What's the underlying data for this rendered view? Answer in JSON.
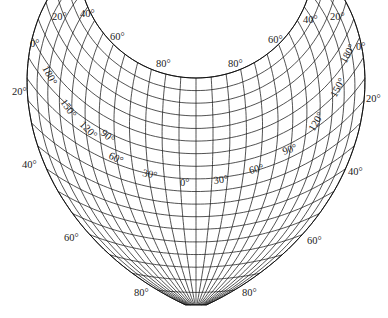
{
  "figure": {
    "type": "map-projection-graticule",
    "line_color": "#1a1a1a",
    "background": "#ffffff"
  },
  "labels": {
    "outer_left": [
      {
        "id": "lat-20-top-left",
        "text": "20°"
      },
      {
        "id": "lat-40-top-left",
        "text": "40°"
      },
      {
        "id": "lat-60-top-left",
        "text": "60°"
      },
      {
        "id": "lat-80-top-left",
        "text": "80°"
      },
      {
        "id": "lat-0-left",
        "text": "0°"
      },
      {
        "id": "lat-20-left",
        "text": "20°"
      },
      {
        "id": "lat-40-left",
        "text": "40°"
      },
      {
        "id": "lat-60-left",
        "text": "60°"
      },
      {
        "id": "lat-80-bottom-left",
        "text": "80°"
      }
    ],
    "outer_right": [
      {
        "id": "lat-20-top-right",
        "text": "20°"
      },
      {
        "id": "lat-40-top-right",
        "text": "40°"
      },
      {
        "id": "lat-60-top-right",
        "text": "60°"
      },
      {
        "id": "lat-80-top-right",
        "text": "80°"
      },
      {
        "id": "lat-0-right",
        "text": "0°"
      },
      {
        "id": "lat-20-right",
        "text": "20°"
      },
      {
        "id": "lat-40-right",
        "text": "40°"
      },
      {
        "id": "lat-60-right",
        "text": "60°"
      },
      {
        "id": "lat-80-bottom-right",
        "text": "80°"
      }
    ],
    "meridians_left": [
      {
        "id": "lon-180-left",
        "text": "180°"
      },
      {
        "id": "lon-150-left",
        "text": "150°"
      },
      {
        "id": "lon-120-left",
        "text": "120°"
      },
      {
        "id": "lon-90-left",
        "text": "90°"
      },
      {
        "id": "lon-60-left",
        "text": "60°"
      },
      {
        "id": "lon-30-left",
        "text": "30°"
      }
    ],
    "meridian_center": {
      "id": "lon-0",
      "text": "0°"
    },
    "meridians_right": [
      {
        "id": "lon-30-right",
        "text": "30°"
      },
      {
        "id": "lon-60-right",
        "text": "60°"
      },
      {
        "id": "lon-90-right",
        "text": "90°"
      },
      {
        "id": "lon-120-right",
        "text": "120°"
      },
      {
        "id": "lon-150-right",
        "text": "150°"
      },
      {
        "id": "lon-180-right",
        "text": "180°"
      }
    ]
  }
}
